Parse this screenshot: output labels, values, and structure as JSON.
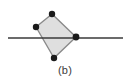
{
  "figure": {
    "caption": "(b)",
    "type": "geometry-diagram",
    "canvas": {
      "width": 130,
      "height": 83
    },
    "colors": {
      "background": "#ffffff",
      "polygon_fill": "#dfdfdf",
      "polygon_stroke": "#8a8a8a",
      "line_stroke": "#3a3a3a",
      "vertex_fill": "#1a1a1a",
      "caption_text": "#3b3b3b"
    },
    "horizontal_line": {
      "name": "cutting-line",
      "x1": 8,
      "y1": 38,
      "x2": 123,
      "y2": 38,
      "stroke_width": 1.6
    },
    "polygon": {
      "name": "shaded-quadrilateral",
      "points": "52,14 36,27 54,58 76,37",
      "stroke_width": 1.4
    },
    "vertices": [
      {
        "name": "vertex-top",
        "label": "top",
        "cx": 52,
        "cy": 14,
        "r": 3.2
      },
      {
        "name": "vertex-left",
        "label": "left",
        "cx": 36,
        "cy": 27,
        "r": 3.2
      },
      {
        "name": "vertex-bottom",
        "label": "bottom",
        "cx": 54,
        "cy": 58,
        "r": 3.2
      },
      {
        "name": "vertex-right",
        "label": "right",
        "cx": 76,
        "cy": 37,
        "r": 3.4
      }
    ]
  }
}
